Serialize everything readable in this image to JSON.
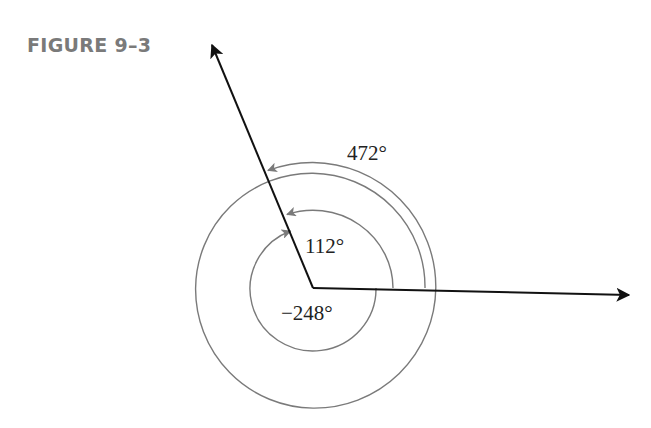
{
  "figure": {
    "label": "FIGURE 9–3"
  },
  "diagram": {
    "vertex": [
      313,
      288
    ],
    "initial_side_direction_deg": 0,
    "terminal_side_direction_deg": 112,
    "angles": [
      {
        "id": "angle-112",
        "label": "112°",
        "value_deg": 112,
        "direction": "counterclockwise"
      },
      {
        "id": "angle-neg-248",
        "label": "−248°",
        "value_deg": -248,
        "direction": "clockwise"
      },
      {
        "id": "angle-472",
        "label": "472°",
        "value_deg": 472,
        "direction": "counterclockwise"
      }
    ],
    "colors": {
      "ray": "#111111",
      "arc": "#7a7a7a",
      "label": "#222222",
      "figure_label": "#7a7a7a"
    }
  }
}
